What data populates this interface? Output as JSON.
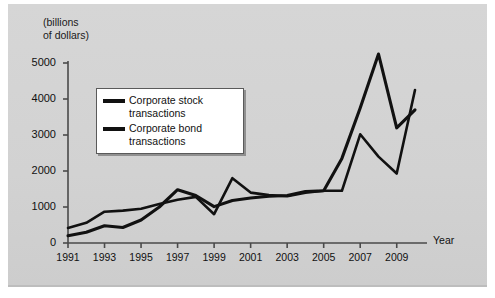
{
  "chart_data": {
    "type": "line",
    "title": "",
    "ylabel": "(billions\nof dollars)",
    "xlabel": "Year",
    "ylim": [
      0,
      5000
    ],
    "xlim": [
      1991,
      2010
    ],
    "grid": false,
    "legend_position": "upper-left-inside",
    "ytick_labels": [
      "0",
      "1000",
      "2000",
      "3000",
      "4000",
      "5000"
    ],
    "ytick_values": [
      0,
      1000,
      2000,
      3000,
      4000,
      5000
    ],
    "xtick_labels": [
      "1991",
      "1993",
      "1995",
      "1997",
      "1999",
      "2001",
      "2003",
      "2005",
      "2007",
      "2009"
    ],
    "xtick_values": [
      1991,
      1993,
      1995,
      1997,
      1999,
      2001,
      2003,
      2005,
      2007,
      2009
    ],
    "x": [
      1991,
      1992,
      1993,
      1994,
      1995,
      1996,
      1997,
      1998,
      1999,
      2000,
      2001,
      2002,
      2003,
      2004,
      2005,
      2006,
      2007,
      2008,
      2009,
      2010
    ],
    "series": [
      {
        "name": "Corporate stock transactions",
        "color": "#111111",
        "values": [
          200,
          300,
          480,
          430,
          640,
          1000,
          1480,
          1320,
          1010,
          1180,
          1250,
          1300,
          1320,
          1430,
          1450,
          2350,
          3750,
          5250,
          3200,
          3700
        ]
      },
      {
        "name": "Corporate bond transactions",
        "color": "#111111",
        "values": [
          420,
          560,
          870,
          900,
          950,
          1080,
          1200,
          1280,
          800,
          1800,
          1400,
          1330,
          1300,
          1400,
          1450,
          1450,
          3020,
          2400,
          1930,
          4250
        ]
      }
    ],
    "legend": [
      {
        "label_line1": "Corporate stock",
        "label_line2": "transactions",
        "swatch_color": "#111111"
      },
      {
        "label_line1": "Corporate bond",
        "label_line2": "transactions",
        "swatch_color": "#111111"
      }
    ],
    "axis_color": "#4a4a4a",
    "background_color": "#d4d4d4"
  }
}
